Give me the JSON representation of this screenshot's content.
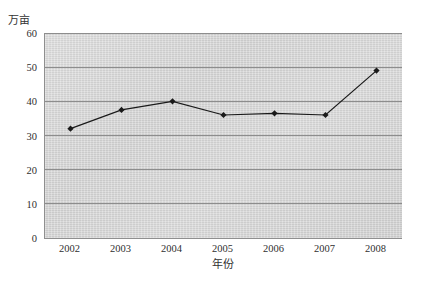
{
  "ghost_text": {
    "top": "",
    "bottom": ""
  },
  "axes": {
    "y_unit_label": "万亩",
    "x_axis_title": "年份",
    "y_ticks": [
      "0",
      "10",
      "20",
      "30",
      "40",
      "50",
      "60"
    ],
    "x_ticks": [
      "2002",
      "2003",
      "2004",
      "2005",
      "2006",
      "2007",
      "2008"
    ]
  },
  "style": {
    "plot_background": "#d4d4d4",
    "gridline_color": "#8d8d8d",
    "series_color": "#1a1a1a",
    "axis_color": "#8f8f8f"
  },
  "chart_data": {
    "type": "line",
    "title": "",
    "xlabel": "年份",
    "ylabel": "万亩",
    "categories": [
      "2002",
      "2003",
      "2004",
      "2005",
      "2006",
      "2007",
      "2008"
    ],
    "values": [
      32,
      37.5,
      40,
      36,
      36.5,
      36,
      49
    ],
    "series": [
      {
        "name": "面积",
        "values": [
          32,
          37.5,
          40,
          36,
          36.5,
          36,
          49
        ]
      }
    ],
    "ylim": [
      0,
      60
    ],
    "ytick_step": 10,
    "grid": true,
    "legend": false,
    "marker": "diamond",
    "marker_color": "#1a1a1a",
    "line_color": "#1a1a1a"
  }
}
